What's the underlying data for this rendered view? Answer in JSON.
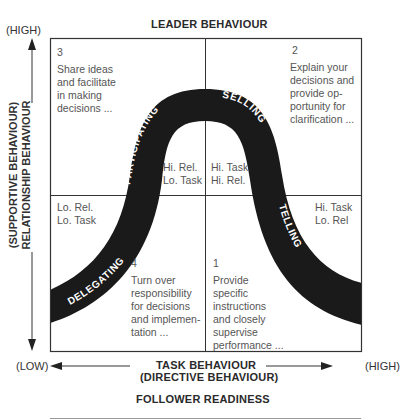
{
  "title": "LEADER BEHAVIOUR",
  "y_axis": {
    "high_label": "(HIGH)",
    "line1": "(SUPPORTIVE BEHAVIOUR)",
    "line2": "RELATIONSHIP BEHAVIOUR"
  },
  "x_axis": {
    "low_label": "(LOW)",
    "high_label": "(HIGH)",
    "line1": "TASK BEHAVIOUR",
    "line2": "(DIRECTIVE BEHAVIOUR)"
  },
  "footer": "FOLLOWER READINESS",
  "quadrants": [
    {
      "id": "q3",
      "number": "3",
      "text": "Share ideas\nand facilitate\nin making\ndecisions ...",
      "corner": "Hi. Rel.\nLo. Task",
      "style": "PARTICIPATING"
    },
    {
      "id": "q2",
      "number": "2",
      "text": "Explain your\ndecisions and\nprovide op-\nportunity for\nclarification ...",
      "corner": "Hi. Task\nHi. Rel.",
      "style": "SELLING"
    },
    {
      "id": "q4",
      "number": "4",
      "text": "Turn over\nresponsibility\nfor decisions\nand implemen-\ntation ...",
      "corner": "Lo. Rel.\nLo. Task",
      "style": "DELEGATING"
    },
    {
      "id": "q1",
      "number": "1",
      "text": "Provide\nspecific\ninstructions\nand closely\nsupervise\nperformance ...",
      "corner": "Hi. Task\nLo. Rel",
      "style": "TELLING"
    }
  ],
  "colors": {
    "curve": "#1a1a1a",
    "line": "#333333",
    "text": "#555555"
  }
}
